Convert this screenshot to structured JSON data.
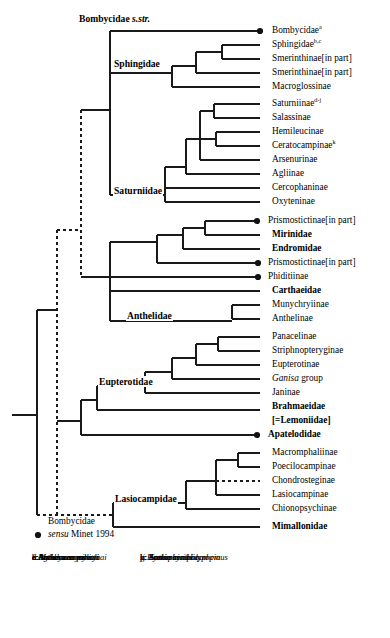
{
  "figure": {
    "type": "phylogenetic-cladogram",
    "line_color": "#1a1a1a",
    "background_color": "#ffffff"
  },
  "clade_labels": [
    {
      "id": "bombycidae-sstr",
      "text": "Bombycidae s.str.",
      "italic_part": "s.str.",
      "x": 78,
      "y": 19
    },
    {
      "id": "sphingidae",
      "text": "Sphingidae",
      "x": 113,
      "y": 63
    },
    {
      "id": "saturniidae",
      "text": "Saturniidae",
      "x": 115,
      "y": 189
    },
    {
      "id": "anthelidae",
      "text": "Anthelidae",
      "x": 118,
      "y": 315
    },
    {
      "id": "eupterotidae",
      "text": "Eupterotidae",
      "x": 104,
      "y": 378
    },
    {
      "id": "lasiocampidae",
      "text": "Lasiocampidae",
      "x": 112,
      "y": 497
    }
  ],
  "plain_labels": [
    {
      "id": "bombycidae-sensu",
      "line1": "Bombycidae",
      "line2": "sensu Minet 1994",
      "italic_part": "sensu",
      "x": 32,
      "y": 521
    }
  ],
  "taxa": [
    {
      "id": "bombycidae",
      "label": "Bombycidae",
      "sup": "a",
      "bold": false,
      "dot": true,
      "y": 31,
      "tip_x": 262,
      "label_x": 272
    },
    {
      "id": "sphingidae-tip",
      "label": "Sphingidae",
      "sup": "b,c",
      "bold": false,
      "dot": false,
      "y": 45,
      "tip_x": 262,
      "label_x": 272
    },
    {
      "id": "smerinthinae-1",
      "label": "Smerinthinae[in part]",
      "sup": "",
      "bold": false,
      "dot": false,
      "y": 59,
      "tip_x": 262,
      "label_x": 272
    },
    {
      "id": "smerinthinae-2",
      "label": "Smerinthinae[in part]",
      "sup": "",
      "bold": false,
      "dot": false,
      "y": 73,
      "tip_x": 262,
      "label_x": 272
    },
    {
      "id": "macroglossinae",
      "label": "Macroglossinae",
      "sup": "",
      "bold": false,
      "dot": false,
      "y": 87,
      "tip_x": 262,
      "label_x": 272
    },
    {
      "id": "saturniinae",
      "label": "Saturniinae",
      "sup": "d-j",
      "bold": false,
      "dot": false,
      "y": 104,
      "tip_x": 262,
      "label_x": 272
    },
    {
      "id": "salassinae",
      "label": "Salassinae",
      "sup": "",
      "bold": false,
      "dot": false,
      "y": 118,
      "tip_x": 262,
      "label_x": 272
    },
    {
      "id": "hemileucinae",
      "label": "Hemileucinae",
      "sup": "",
      "bold": false,
      "dot": false,
      "y": 132,
      "tip_x": 262,
      "label_x": 272
    },
    {
      "id": "ceratocampinae",
      "label": "Ceratocampinae",
      "sup": "k",
      "bold": false,
      "dot": false,
      "y": 146,
      "tip_x": 262,
      "label_x": 272
    },
    {
      "id": "arsenurinae",
      "label": "Arsenurinae",
      "sup": "",
      "bold": false,
      "dot": false,
      "y": 160,
      "tip_x": 262,
      "label_x": 272
    },
    {
      "id": "agliinae",
      "label": "Agliinae",
      "sup": "",
      "bold": false,
      "dot": false,
      "y": 174,
      "tip_x": 262,
      "label_x": 272
    },
    {
      "id": "cercophaninae",
      "label": "Cercophaninae",
      "sup": "",
      "bold": false,
      "dot": false,
      "y": 188,
      "tip_x": 262,
      "label_x": 272
    },
    {
      "id": "oxyteninae",
      "label": "Oxyteninae",
      "sup": "",
      "bold": false,
      "dot": false,
      "y": 202,
      "tip_x": 262,
      "label_x": 272
    },
    {
      "id": "prismostictinae-1",
      "label": "Prismostictinae[in part]",
      "sup": "",
      "bold": false,
      "dot": true,
      "y": 221,
      "tip_x": 262,
      "label_x": 272
    },
    {
      "id": "mirinidae",
      "label": "Mirinidae",
      "sup": "",
      "bold": true,
      "dot": false,
      "y": 235,
      "tip_x": 262,
      "label_x": 272
    },
    {
      "id": "endromidae",
      "label": "Endromidae",
      "sup": "",
      "bold": true,
      "dot": false,
      "y": 249,
      "tip_x": 262,
      "label_x": 272
    },
    {
      "id": "prismostictinae-2",
      "label": "Prismostictinae[in part]",
      "sup": "",
      "bold": false,
      "dot": true,
      "y": 263,
      "tip_x": 262,
      "label_x": 272
    },
    {
      "id": "phiditiinae",
      "label": "Phiditiinae",
      "sup": "",
      "bold": false,
      "dot": true,
      "y": 277,
      "tip_x": 262,
      "label_x": 272
    },
    {
      "id": "carthaeidae",
      "label": "Carthaeidae",
      "sup": "",
      "bold": true,
      "dot": false,
      "y": 291,
      "tip_x": 262,
      "label_x": 272
    },
    {
      "id": "munychryiinae",
      "label": "Munychryiinae",
      "sup": "",
      "bold": false,
      "dot": false,
      "y": 305,
      "tip_x": 262,
      "label_x": 272
    },
    {
      "id": "anthelinae",
      "label": "Anthelinae",
      "sup": "",
      "bold": false,
      "dot": false,
      "y": 319,
      "tip_x": 262,
      "label_x": 272
    },
    {
      "id": "panacelinae",
      "label": "Panacelinae",
      "sup": "",
      "bold": false,
      "dot": false,
      "y": 337,
      "tip_x": 262,
      "label_x": 272
    },
    {
      "id": "striphnopteryginae",
      "label": "Striphnopteryginae",
      "sup": "",
      "bold": false,
      "dot": false,
      "y": 351,
      "tip_x": 262,
      "label_x": 272
    },
    {
      "id": "eupterotinae",
      "label": "Eupterotinae",
      "sup": "",
      "bold": false,
      "dot": false,
      "y": 365,
      "tip_x": 262,
      "label_x": 272
    },
    {
      "id": "ganisa-group",
      "label": "Ganisa group",
      "italic_prefix": "Ganisa",
      "sup": "",
      "bold": false,
      "dot": false,
      "y": 379,
      "tip_x": 262,
      "label_x": 272
    },
    {
      "id": "janinae",
      "label": "Janinae",
      "sup": "",
      "bold": false,
      "dot": false,
      "y": 393,
      "tip_x": 262,
      "label_x": 272
    },
    {
      "id": "brahmaeidae",
      "label": "Brahmaeidae",
      "sup": "",
      "bold": true,
      "dot": false,
      "y": 407,
      "tip_x": 262,
      "label_x": 272,
      "sublabel": "[=Lemoniidae]"
    },
    {
      "id": "apatelodidae",
      "label": "Apatelodidae",
      "sup": "",
      "bold": true,
      "dot": true,
      "y": 435,
      "tip_x": 262,
      "label_x": 272
    },
    {
      "id": "macromphaliinae",
      "label": "Macromphaliinae",
      "sup": "",
      "bold": false,
      "dot": false,
      "y": 453,
      "tip_x": 262,
      "label_x": 272
    },
    {
      "id": "poecilocampinae",
      "label": "Poecilocampinae",
      "sup": "",
      "bold": false,
      "dot": false,
      "y": 467,
      "tip_x": 262,
      "label_x": 272
    },
    {
      "id": "chondrosteginae",
      "label": "Chondrosteginae",
      "sup": "",
      "bold": false,
      "dot": false,
      "y": 481,
      "tip_x": 262,
      "label_x": 272,
      "dashed_tip": true
    },
    {
      "id": "lasiocampinae",
      "label": "Lasiocampinae",
      "sup": "",
      "bold": false,
      "dot": false,
      "y": 495,
      "tip_x": 262,
      "label_x": 272
    },
    {
      "id": "chionopsychinae",
      "label": "Chionopsychinae",
      "sup": "",
      "bold": false,
      "dot": false,
      "y": 509,
      "tip_x": 262,
      "label_x": 272
    },
    {
      "id": "mimallonidae",
      "label": "Mimallonidae",
      "sup": "",
      "bold": true,
      "dot": false,
      "y": 527,
      "tip_x": 262,
      "label_x": 272
    }
  ],
  "legend": {
    "symbol_note": "sensu Minet 1994",
    "column_left": [
      {
        "key": "a",
        "name": "Bombyx mori"
      },
      {
        "key": "b",
        "name": "Manduca sexta"
      },
      {
        "key": "c",
        "name": "Agrius convolvuli"
      },
      {
        "key": "d",
        "name": "Antheraea pernyi"
      },
      {
        "key": "e",
        "name": "Antheraea mylitta"
      },
      {
        "key": "f",
        "name": "Antheraea yamamai"
      }
    ],
    "column_right": [
      {
        "key": "g",
        "name": "Antheraea polyphemus"
      },
      {
        "key": "h",
        "name": "Samia cynthia"
      },
      {
        "key": "i",
        "name": "Samia ricini"
      },
      {
        "key": "j",
        "name": "Hyalophora cecropia"
      },
      {
        "key": "k",
        "name": "Lonomia obliqua"
      }
    ]
  }
}
